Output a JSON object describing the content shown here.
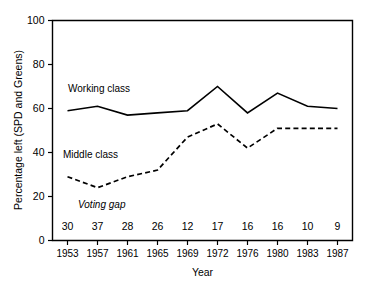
{
  "chart_data": {
    "type": "line",
    "title": "",
    "xlabel": "Year",
    "ylabel": "Percentage left (SPD and Greens)",
    "categories": [
      "1953",
      "1957",
      "1961",
      "1965",
      "1969",
      "1972",
      "1976",
      "1980",
      "1983",
      "1987"
    ],
    "ylim": [
      0,
      100
    ],
    "yticks": [
      0,
      20,
      40,
      60,
      80,
      100
    ],
    "ytick_labels": [
      "0",
      "20",
      "40",
      "60",
      "80",
      "100"
    ],
    "grid": false,
    "legend": "inline-annotations",
    "series": [
      {
        "name": "Working class",
        "style": "solid",
        "values": [
          59,
          61,
          57,
          58,
          59,
          70,
          58,
          67,
          61,
          60
        ]
      },
      {
        "name": "Middle class",
        "style": "dashed",
        "values": [
          29,
          24,
          29,
          32,
          47,
          53,
          42,
          51,
          51,
          51
        ]
      }
    ],
    "annotations": {
      "voting_gap_label": "Voting gap",
      "voting_gap_values": [
        30,
        37,
        28,
        26,
        12,
        17,
        16,
        16,
        10,
        9
      ]
    },
    "series_labels": [
      {
        "text": "Working class",
        "style": "normal"
      },
      {
        "text": "Middle class",
        "style": "normal"
      },
      {
        "text": "Voting gap",
        "style": "italic"
      }
    ]
  }
}
